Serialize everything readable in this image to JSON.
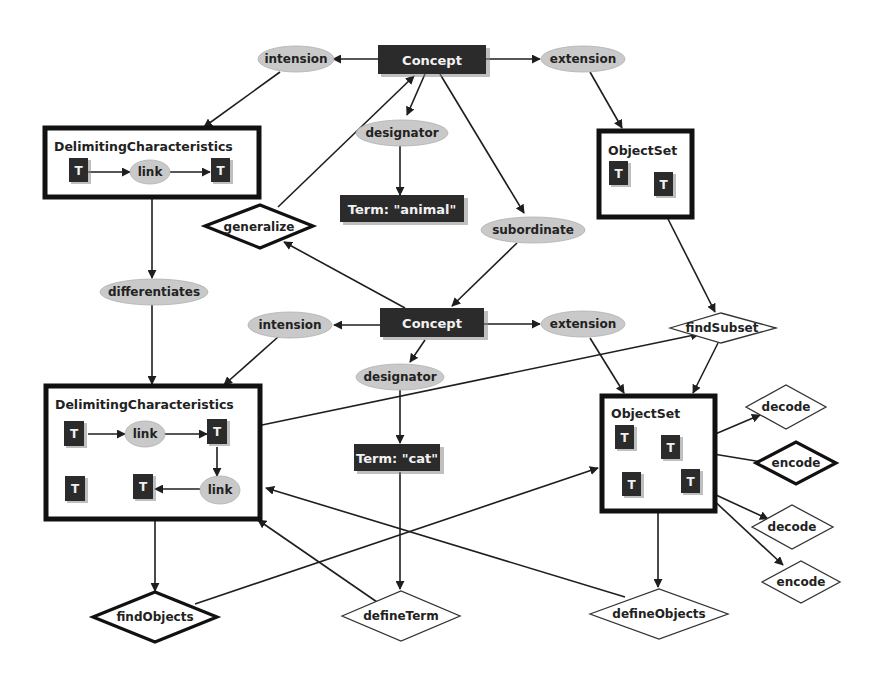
{
  "diagram": {
    "concepts": {
      "top": "Concept",
      "bottom": "Concept"
    },
    "terms": {
      "top": "Term: \"animal\"",
      "bottom": "Term: \"cat\""
    },
    "relations": {
      "intension_top": "intension",
      "extension_top": "extension",
      "designator_top": "designator",
      "subordinate": "subordinate",
      "differentiates": "differentiates",
      "intension_bottom": "intension",
      "extension_bottom": "extension",
      "designator_bottom": "designator",
      "link_top": "link",
      "link_bottom_1": "link",
      "link_bottom_2": "link"
    },
    "containers": {
      "dc_top": "DelimitingCharacteristics",
      "dc_bottom": "DelimitingCharacteristics",
      "os_top": "ObjectSet",
      "os_bottom": "ObjectSet"
    },
    "token_label": "T",
    "operations": {
      "generalize": "generalize",
      "findSubset": "findSubset",
      "decode_1": "decode",
      "encode_1": "encode",
      "decode_2": "decode",
      "encode_2": "encode",
      "findObjects": "findObjects",
      "defineTerm": "defineTerm",
      "defineObjects": "defineObjects"
    }
  },
  "colors": {
    "dark_node": "#2b2b2b",
    "relation_ellipse": "#c9c9c9",
    "edge": "#1e1e1e",
    "background": "#ffffff"
  }
}
